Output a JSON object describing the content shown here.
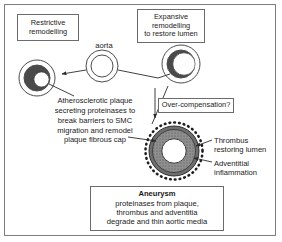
{
  "figure": {
    "title_hidden": "",
    "frame": {
      "visible": true,
      "color": "#7d7d7d"
    }
  },
  "boxes": {
    "restrictive": {
      "line1": "Restrictive",
      "line2": "remodelling"
    },
    "expansive": {
      "line1": "Expansive",
      "line2": "remodelling",
      "line3": "to restore lumen"
    },
    "overcompensation": {
      "label": "Over-compensation?"
    },
    "aneurysm": {
      "heading": "Aneurysm",
      "line1": "proteinases from plaque,",
      "line2": "thrombus and adventitia",
      "line3": "degrade and thin aortic media"
    }
  },
  "labels": {
    "aorta": "aorta",
    "plaque": {
      "line1": "Atherosclerotic plaque",
      "line2": "secreting proteinases to",
      "line3": "break barriers to SMC",
      "line4": "migration and remodel",
      "line5": "plaque fibrous cap"
    },
    "thrombus": {
      "line1": "Thrombus",
      "line2": "restoring lumen"
    },
    "adventitial": {
      "line1": "Adventitial",
      "line2": "inflammation"
    }
  },
  "diagram": {
    "vessels": [
      {
        "name": "aorta-normal",
        "cx": 102,
        "cy": 66,
        "outer_r": 16,
        "inner_r": 11,
        "plaque": false,
        "wall_color": "#ffffff",
        "lumen_color": "#ffffff"
      },
      {
        "name": "restrictive-vessel",
        "cx": 37,
        "cy": 78,
        "outer_r": 18,
        "inner_r": 13,
        "plaque": true,
        "plaque_color": "#4a4a4a",
        "lumen_color": "#ffffff",
        "lumen_size": "small"
      },
      {
        "name": "expansive-vessel",
        "cx": 181,
        "cy": 64,
        "outer_r": 19,
        "inner_r": 14,
        "plaque": true,
        "plaque_color": "#4a4a4a",
        "lumen_color": "#ffffff",
        "lumen_size": "large"
      },
      {
        "name": "aneurysm-vessel",
        "cx": 174,
        "cy": 151,
        "outer_r": 28,
        "thrombus_r": 24,
        "lumen_r": 13,
        "thrombus_color": "#9a9a9a",
        "media_color": "#5a5a5a",
        "lumen_color": "#ffffff",
        "adventitia_dots": true
      }
    ],
    "colors": {
      "stroke": "#4d4d4d",
      "text": "#1a1a1a",
      "box_border": "#6b6b6b",
      "plaque_dark": "#4a4a4a",
      "thrombus_gray": "#9a9a9a",
      "media_gray": "#6e6e6e"
    }
  }
}
